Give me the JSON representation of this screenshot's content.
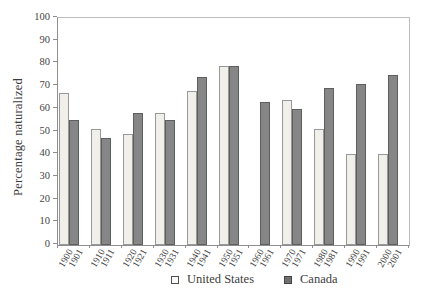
{
  "chart_data": {
    "type": "bar",
    "title": "",
    "xlabel": "",
    "ylabel": "Percentage naturalized",
    "ylim": [
      0,
      100
    ],
    "ytick_interval": 10,
    "yticks": [
      0,
      10,
      20,
      30,
      40,
      50,
      60,
      70,
      80,
      90,
      100
    ],
    "grid": false,
    "legend_position": "bottom",
    "bar_labels_rotated": true,
    "series": [
      {
        "name": "United States",
        "fill_color": "#f0efea",
        "border_color": "#98989a",
        "categories": [
          "1900",
          "1910",
          "1920",
          "1930",
          "1940",
          "1950",
          "1960",
          "1970",
          "1980",
          "1990",
          "2000"
        ],
        "values": [
          67,
          51,
          49,
          58,
          68,
          79,
          null,
          64,
          51,
          40,
          40
        ]
      },
      {
        "name": "Canada",
        "fill_color": "#868686",
        "border_color": "#5e5e5e",
        "categories": [
          "1901",
          "1911",
          "1921",
          "1931",
          "1941",
          "1951",
          "1961",
          "1971",
          "1981",
          "1991",
          "2001"
        ],
        "values": [
          55,
          47,
          58,
          55,
          74,
          79,
          63,
          60,
          69,
          71,
          75
        ]
      }
    ]
  }
}
